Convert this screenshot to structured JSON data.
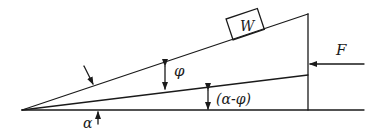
{
  "diagram": {
    "type": "wedge-force-diagram",
    "labels": {
      "weight": "W",
      "force": "F",
      "friction_angle": "φ",
      "wedge_angle": "α",
      "difference_angle": "(α-φ)"
    },
    "elements": [
      {
        "id": "baseline",
        "kind": "line",
        "description": "horizontal base surface"
      },
      {
        "id": "incline",
        "kind": "line",
        "description": "upper inclined surface at angle α"
      },
      {
        "id": "resultant-line",
        "kind": "line",
        "description": "line at angle (α-φ) from base"
      },
      {
        "id": "vertical-face",
        "kind": "line",
        "description": "vertical back face of wedge"
      },
      {
        "id": "block-w",
        "kind": "box",
        "label": "W"
      },
      {
        "id": "force-f",
        "kind": "arrow",
        "label": "F",
        "direction": "left"
      }
    ],
    "colors": {
      "stroke": "#1a1a1a",
      "background": "#ffffff"
    }
  }
}
